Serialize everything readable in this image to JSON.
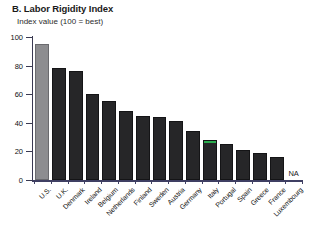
{
  "chart_data": {
    "type": "bar",
    "title": "B. Labor Rigidity Index",
    "subtitle": "Index value (100 = best)",
    "xlabel": "",
    "ylabel": "Index value (100 = best)",
    "ylim": [
      0,
      100
    ],
    "yticks": [
      0,
      20,
      40,
      60,
      80,
      100
    ],
    "ytick_labels": [
      "0",
      "20",
      "40",
      "60",
      "80",
      "100"
    ],
    "grid": false,
    "legend": "none",
    "categories": [
      "U.S.",
      "U.K.",
      "Denmark",
      "Ireland",
      "Belgium",
      "Netherlands",
      "Finland",
      "Sweden",
      "Austria",
      "Germany",
      "Italy",
      "Portugal",
      "Spain",
      "Greece",
      "France",
      "Luxembourg"
    ],
    "values": [
      95,
      78,
      76,
      60,
      55,
      48,
      45,
      44,
      41,
      34,
      28,
      25,
      21,
      19,
      16,
      null
    ],
    "value_notes": [
      "",
      "",
      "",
      "",
      "",
      "",
      "",
      "",
      "",
      "",
      "",
      "",
      "",
      "",
      "",
      "NA"
    ],
    "na_label": "NA",
    "bar_colors": [
      "#8d8d90",
      "#262628",
      "#262628",
      "#262628",
      "#262628",
      "#262628",
      "#262628",
      "#262628",
      "#262628",
      "#262628",
      "#262628",
      "#262628",
      "#262628",
      "#262628",
      "#262628",
      "#262628"
    ],
    "highlight": {
      "category": "Italy",
      "cap_color": "#2bad4e"
    },
    "axis_color": "#3f3f63",
    "text_color": "#111111"
  }
}
